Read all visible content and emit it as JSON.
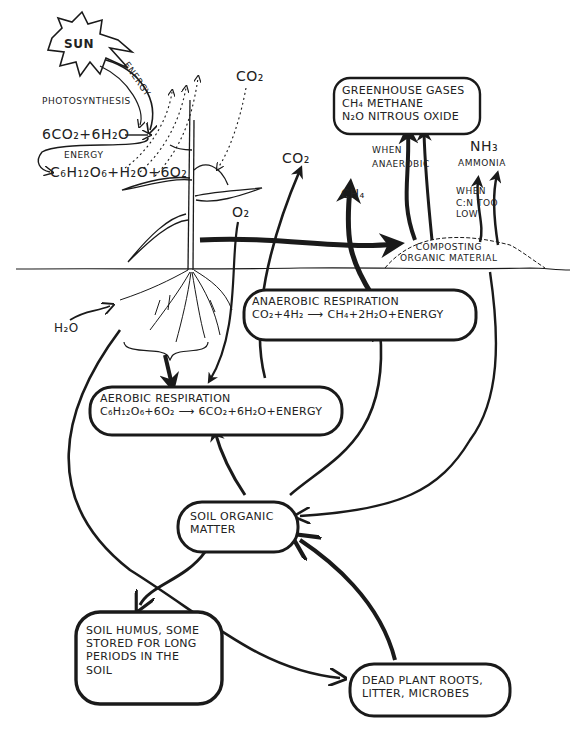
{
  "diagram": {
    "type": "hand-drawn carbon cycle in soil",
    "colors": {
      "ink": "#1a1a1a",
      "background": "#ffffff"
    },
    "sun": {
      "label": "SUN"
    },
    "energy_top": "ENERGY",
    "photosynthesis": {
      "title": "PHOTOSYNTHESIS",
      "reactants": "6CO₂+6H₂O",
      "energy": "ENERGY",
      "products": "C₆H₁₂O₆+H₂O+6O₂"
    },
    "atmosphere": {
      "co2_top": "CO₂",
      "co2_right": "CO₂",
      "o2": "O₂",
      "ch4": "CH₄",
      "h2o": "H₂O"
    },
    "greenhouse": {
      "title": "GREENHOUSE GASES",
      "line1": "CH₄ METHANE",
      "line2": "N₂O NITROUS OXIDE"
    },
    "when_anaerobic": [
      "WHEN",
      "ANAEROBIC"
    ],
    "ammonia": {
      "formula": "NH₃",
      "name": "AMMONIA",
      "condition": [
        "WHEN",
        "C:N TOO",
        "LOW"
      ]
    },
    "compost": [
      "COMPOSTING",
      "ORGANIC MATERIAL"
    ],
    "anaerobic": {
      "title": "ANAEROBIC RESPIRATION",
      "equation": "CO₂+4H₂ ⟶ CH₄+2H₂O+ENERGY"
    },
    "aerobic": {
      "title": "AEROBIC RESPIRATION",
      "equation": "C₆H₁₂O₆+6O₂ ⟶ 6CO₂+6H₂O+ENERGY"
    },
    "soil_organic": [
      "SOIL ORGANIC",
      "MATTER"
    ],
    "humus": [
      "SOIL HUMUS, SOME",
      "STORED FOR LONG",
      "PERIODS IN THE",
      "SOIL"
    ],
    "dead": [
      "DEAD PLANT ROOTS,",
      "LITTER, MICROBES"
    ]
  }
}
